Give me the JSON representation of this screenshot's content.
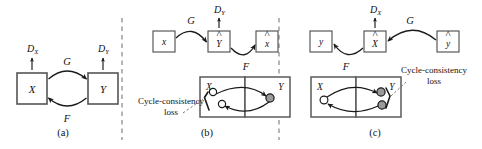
{
  "figure": {
    "background": "#ffffff",
    "stroke_color": "#1a1a1a",
    "box_stroke": "#555555",
    "sample_fill_gray": "#9a9a9a",
    "sample_fill_white": "#ffffff"
  },
  "panels": [
    {
      "id": "a",
      "caption": "(a)",
      "nodes": [
        {
          "name": "domain-x",
          "label": "X"
        },
        {
          "name": "domain-y",
          "label": "Y"
        }
      ],
      "discriminators": [
        {
          "name": "discriminator-x",
          "base": "D",
          "sub": "X"
        },
        {
          "name": "discriminator-y",
          "base": "D",
          "sub": "Y"
        }
      ],
      "mappings": [
        {
          "name": "generator-g",
          "label": "G",
          "from": "X",
          "to": "Y"
        },
        {
          "name": "generator-f",
          "label": "F",
          "from": "Y",
          "to": "X"
        }
      ]
    },
    {
      "id": "b",
      "caption": "(b)",
      "top_row": [
        {
          "name": "input-x",
          "label": "x",
          "hat": false
        },
        {
          "name": "generated-y-hat",
          "label": "Y",
          "hat": true
        },
        {
          "name": "reconstructed-x-hat",
          "label": "x",
          "hat": true
        }
      ],
      "discriminator": {
        "name": "discriminator-y",
        "base": "D",
        "sub": "Y"
      },
      "mappings": [
        {
          "name": "generator-g",
          "label": "G"
        },
        {
          "name": "generator-f",
          "label": "F"
        }
      ],
      "domain_boxes": [
        {
          "name": "domain-box-x",
          "label": "X"
        },
        {
          "name": "domain-box-y",
          "label": "Y"
        }
      ],
      "loss": {
        "name": "cycle-consistency-loss",
        "line1": "Cycle-consistency",
        "line2": "loss"
      },
      "samples": [
        {
          "name": "sample-x-source",
          "style": "open"
        },
        {
          "name": "sample-x-reconstructed",
          "style": "open"
        },
        {
          "name": "sample-y-generated",
          "style": "filled"
        }
      ]
    },
    {
      "id": "c",
      "caption": "(c)",
      "top_row": [
        {
          "name": "reconstructed-y-target",
          "label": "y",
          "hat": false
        },
        {
          "name": "generated-x-hat",
          "label": "X",
          "hat": true
        },
        {
          "name": "input-y-hat",
          "label": "y",
          "hat": true
        }
      ],
      "discriminator": {
        "name": "discriminator-x",
        "base": "D",
        "sub": "X"
      },
      "mappings": [
        {
          "name": "generator-g",
          "label": "G"
        },
        {
          "name": "generator-f",
          "label": "F"
        }
      ],
      "domain_boxes": [
        {
          "name": "domain-box-x",
          "label": "X"
        },
        {
          "name": "domain-box-y",
          "label": "Y"
        }
      ],
      "loss": {
        "name": "cycle-consistency-loss",
        "line1": "Cycle-consistency",
        "line2": "loss"
      },
      "samples": [
        {
          "name": "sample-x-generated",
          "style": "open"
        },
        {
          "name": "sample-y-source",
          "style": "filled"
        },
        {
          "name": "sample-y-reconstructed",
          "style": "filled"
        }
      ]
    }
  ]
}
